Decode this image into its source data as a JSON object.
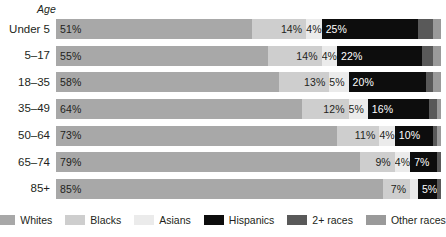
{
  "chart_data": {
    "type": "bar",
    "subtype": "stacked-horizontal-100",
    "title": "",
    "xlabel": "",
    "ylabel": "Age",
    "axis_title": "Age",
    "grid": false,
    "legend_position": "bottom",
    "xlim": [
      0,
      100
    ],
    "categories": [
      "Under 5",
      "5–17",
      "18–35",
      "35–49",
      "50–64",
      "65–74",
      "85+"
    ],
    "series": [
      {
        "name": "Whites",
        "color": "#a8a8a8",
        "values": [
          51,
          55,
          58,
          64,
          73,
          79,
          85
        ]
      },
      {
        "name": "Blacks",
        "color": "#cecece",
        "values": [
          14,
          14,
          13,
          12,
          11,
          9,
          7
        ]
      },
      {
        "name": "Asians",
        "color": "#ebebeb",
        "values": [
          4,
          4,
          5,
          5,
          4,
          4,
          2
        ]
      },
      {
        "name": "Hispanics",
        "color": "#0d0d0d",
        "values": [
          25,
          22,
          20,
          16,
          10,
          7,
          5
        ]
      },
      {
        "name": "2+ races",
        "color": "#595959",
        "values": [
          4,
          3,
          2,
          2,
          1,
          1,
          1
        ]
      },
      {
        "name": "Other races",
        "color": "#9a9a9a",
        "values": [
          2,
          2,
          2,
          1,
          1,
          0,
          0
        ]
      }
    ],
    "data_labels": {
      "Under 5": {
        "Whites": "51%",
        "Blacks": "14%",
        "Asians": "4%",
        "Hispanics": "25%",
        "2+ races": "",
        "Other races": ""
      },
      "5–17": {
        "Whites": "55%",
        "Blacks": "14%",
        "Asians": "4%",
        "Hispanics": "22%",
        "2+ races": "",
        "Other races": ""
      },
      "18–35": {
        "Whites": "58%",
        "Blacks": "13%",
        "Asians": "5%",
        "Hispanics": "20%",
        "2+ races": "",
        "Other races": ""
      },
      "35–49": {
        "Whites": "64%",
        "Blacks": "12%",
        "Asians": "5%",
        "Hispanics": "16%",
        "2+ races": "",
        "Other races": ""
      },
      "50–64": {
        "Whites": "73%",
        "Blacks": "11%",
        "Asians": "4%",
        "Hispanics": "10%",
        "2+ races": "",
        "Other races": ""
      },
      "65–74": {
        "Whites": "79%",
        "Blacks": "9%",
        "Asians": "4%",
        "Hispanics": "7%",
        "2+ races": "",
        "Other races": ""
      },
      "85+": {
        "Whites": "85%",
        "Blacks": "7%",
        "Asians": "",
        "Hispanics": "5%",
        "2+ races": "",
        "Other races": ""
      }
    }
  },
  "axis": {
    "title": "Age"
  },
  "rows": [
    {
      "label": "Under 5",
      "segments": [
        {
          "series": "Whites",
          "value": 51,
          "label": "51%",
          "color": "#a8a8a8",
          "text": "dark",
          "align": "left"
        },
        {
          "series": "Blacks",
          "value": 14,
          "label": "14%",
          "color": "#cecece",
          "text": "dark",
          "align": "right"
        },
        {
          "series": "Asians",
          "value": 4,
          "label": "4%",
          "color": "#ebebeb",
          "text": "dark",
          "align": "right"
        },
        {
          "series": "Hispanics",
          "value": 25,
          "label": "25%",
          "color": "#0d0d0d",
          "text": "light",
          "align": "left"
        },
        {
          "series": "2+ races",
          "value": 4,
          "label": "",
          "color": "#595959",
          "text": "light",
          "align": "left"
        },
        {
          "series": "Other races",
          "value": 2,
          "label": "",
          "color": "#9a9a9a",
          "text": "dark",
          "align": "left"
        }
      ]
    },
    {
      "label": "5–17",
      "segments": [
        {
          "series": "Whites",
          "value": 55,
          "label": "55%",
          "color": "#a8a8a8",
          "text": "dark",
          "align": "left"
        },
        {
          "series": "Blacks",
          "value": 14,
          "label": "14%",
          "color": "#cecece",
          "text": "dark",
          "align": "right"
        },
        {
          "series": "Asians",
          "value": 4,
          "label": "4%",
          "color": "#ebebeb",
          "text": "dark",
          "align": "right"
        },
        {
          "series": "Hispanics",
          "value": 22,
          "label": "22%",
          "color": "#0d0d0d",
          "text": "light",
          "align": "left"
        },
        {
          "series": "2+ races",
          "value": 3,
          "label": "",
          "color": "#595959",
          "text": "light",
          "align": "left"
        },
        {
          "series": "Other races",
          "value": 2,
          "label": "",
          "color": "#9a9a9a",
          "text": "dark",
          "align": "left"
        }
      ]
    },
    {
      "label": "18–35",
      "segments": [
        {
          "series": "Whites",
          "value": 58,
          "label": "58%",
          "color": "#a8a8a8",
          "text": "dark",
          "align": "left"
        },
        {
          "series": "Blacks",
          "value": 13,
          "label": "13%",
          "color": "#cecece",
          "text": "dark",
          "align": "right"
        },
        {
          "series": "Asians",
          "value": 5,
          "label": "5%",
          "color": "#ebebeb",
          "text": "dark",
          "align": "right"
        },
        {
          "series": "Hispanics",
          "value": 20,
          "label": "20%",
          "color": "#0d0d0d",
          "text": "light",
          "align": "left"
        },
        {
          "series": "2+ races",
          "value": 2,
          "label": "",
          "color": "#595959",
          "text": "light",
          "align": "left"
        },
        {
          "series": "Other races",
          "value": 2,
          "label": "",
          "color": "#9a9a9a",
          "text": "dark",
          "align": "left"
        }
      ]
    },
    {
      "label": "35–49",
      "segments": [
        {
          "series": "Whites",
          "value": 64,
          "label": "64%",
          "color": "#a8a8a8",
          "text": "dark",
          "align": "left"
        },
        {
          "series": "Blacks",
          "value": 12,
          "label": "12%",
          "color": "#cecece",
          "text": "dark",
          "align": "right"
        },
        {
          "series": "Asians",
          "value": 5,
          "label": "5%",
          "color": "#ebebeb",
          "text": "dark",
          "align": "right"
        },
        {
          "series": "Hispanics",
          "value": 16,
          "label": "16%",
          "color": "#0d0d0d",
          "text": "light",
          "align": "left"
        },
        {
          "series": "2+ races",
          "value": 2,
          "label": "",
          "color": "#595959",
          "text": "light",
          "align": "left"
        },
        {
          "series": "Other races",
          "value": 1,
          "label": "",
          "color": "#9a9a9a",
          "text": "dark",
          "align": "left"
        }
      ]
    },
    {
      "label": "50–64",
      "segments": [
        {
          "series": "Whites",
          "value": 73,
          "label": "73%",
          "color": "#a8a8a8",
          "text": "dark",
          "align": "left"
        },
        {
          "series": "Blacks",
          "value": 11,
          "label": "11%",
          "color": "#cecece",
          "text": "dark",
          "align": "right"
        },
        {
          "series": "Asians",
          "value": 4,
          "label": "4%",
          "color": "#ebebeb",
          "text": "dark",
          "align": "right"
        },
        {
          "series": "Hispanics",
          "value": 10,
          "label": "10%",
          "color": "#0d0d0d",
          "text": "light",
          "align": "left"
        },
        {
          "series": "2+ races",
          "value": 1,
          "label": "",
          "color": "#595959",
          "text": "light",
          "align": "left"
        },
        {
          "series": "Other races",
          "value": 1,
          "label": "",
          "color": "#9a9a9a",
          "text": "dark",
          "align": "left"
        }
      ]
    },
    {
      "label": "65–74",
      "segments": [
        {
          "series": "Whites",
          "value": 79,
          "label": "79%",
          "color": "#a8a8a8",
          "text": "dark",
          "align": "left"
        },
        {
          "series": "Blacks",
          "value": 9,
          "label": "9%",
          "color": "#cecece",
          "text": "dark",
          "align": "right"
        },
        {
          "series": "Asians",
          "value": 4,
          "label": "4%",
          "color": "#ebebeb",
          "text": "dark",
          "align": "right"
        },
        {
          "series": "Hispanics",
          "value": 7,
          "label": "7%",
          "color": "#0d0d0d",
          "text": "light",
          "align": "left"
        },
        {
          "series": "2+ races",
          "value": 1,
          "label": "",
          "color": "#595959",
          "text": "light",
          "align": "left"
        },
        {
          "series": "Other races",
          "value": 0,
          "label": "",
          "color": "#9a9a9a",
          "text": "dark",
          "align": "left"
        }
      ]
    },
    {
      "label": "85+",
      "segments": [
        {
          "series": "Whites",
          "value": 85,
          "label": "85%",
          "color": "#a8a8a8",
          "text": "dark",
          "align": "left"
        },
        {
          "series": "Blacks",
          "value": 7,
          "label": "7%",
          "color": "#cecece",
          "text": "dark",
          "align": "right"
        },
        {
          "series": "Asians",
          "value": 2,
          "label": "",
          "color": "#ebebeb",
          "text": "dark",
          "align": "right"
        },
        {
          "series": "Hispanics",
          "value": 5,
          "label": "5%",
          "color": "#0d0d0d",
          "text": "light",
          "align": "left"
        },
        {
          "series": "2+ races",
          "value": 1,
          "label": "",
          "color": "#595959",
          "text": "light",
          "align": "left"
        },
        {
          "series": "Other races",
          "value": 0,
          "label": "",
          "color": "#9a9a9a",
          "text": "dark",
          "align": "left"
        }
      ]
    }
  ],
  "legend": {
    "items": [
      {
        "label": "Whites",
        "color": "#a8a8a8"
      },
      {
        "label": "Blacks",
        "color": "#cecece"
      },
      {
        "label": "Asians",
        "color": "#ebebeb"
      },
      {
        "label": "Hispanics",
        "color": "#0d0d0d"
      },
      {
        "label": "2+ races",
        "color": "#595959"
      },
      {
        "label": "Other races",
        "color": "#9a9a9a"
      }
    ]
  }
}
